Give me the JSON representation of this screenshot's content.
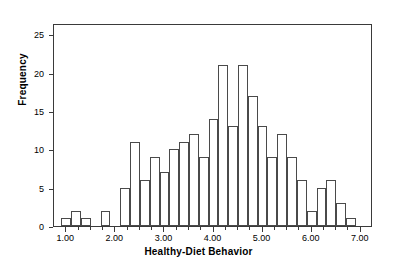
{
  "chart_data": {
    "type": "bar",
    "title": "",
    "xlabel": "Healthy-Diet Behavior",
    "ylabel": "Frequency",
    "xlim": [
      0.75,
      7.25
    ],
    "ylim": [
      0,
      26.5
    ],
    "grid": false,
    "legend": null,
    "bin_width": 0.2,
    "xticks": [
      "1.00",
      "2.00",
      "3.00",
      "4.00",
      "5.00",
      "6.00",
      "7.00"
    ],
    "xtick_values": [
      1,
      2,
      3,
      4,
      5,
      6,
      7
    ],
    "xtick_minor_values": [
      1.25,
      1.5,
      1.75,
      2.25,
      2.5,
      2.75,
      3.25,
      3.5,
      3.75,
      4.25,
      4.5,
      4.75,
      5.25,
      5.5,
      5.75,
      6.25,
      6.5,
      6.75
    ],
    "yticks": [
      "0",
      "5",
      "10",
      "15",
      "20",
      "25"
    ],
    "ytick_values": [
      0,
      5,
      10,
      15,
      20,
      25
    ],
    "bar_face_color": "#ffffff",
    "bar_edge_color": "#4a4a4a",
    "frame_color": "#3a3a3a",
    "bins": [
      {
        "x0": 0.9,
        "x1": 1.1,
        "center": 1.0,
        "value": 1
      },
      {
        "x0": 1.1,
        "x1": 1.3,
        "center": 1.2,
        "value": 2
      },
      {
        "x0": 1.3,
        "x1": 1.5,
        "center": 1.4,
        "value": 1
      },
      {
        "x0": 1.7,
        "x1": 1.9,
        "center": 1.8,
        "value": 2
      },
      {
        "x0": 2.1,
        "x1": 2.3,
        "center": 2.2,
        "value": 5
      },
      {
        "x0": 2.3,
        "x1": 2.5,
        "center": 2.4,
        "value": 11
      },
      {
        "x0": 2.5,
        "x1": 2.7,
        "center": 2.6,
        "value": 6
      },
      {
        "x0": 2.7,
        "x1": 2.9,
        "center": 2.8,
        "value": 9
      },
      {
        "x0": 2.9,
        "x1": 3.1,
        "center": 3.0,
        "value": 7
      },
      {
        "x0": 3.1,
        "x1": 3.3,
        "center": 3.2,
        "value": 10
      },
      {
        "x0": 3.3,
        "x1": 3.5,
        "center": 3.4,
        "value": 11
      },
      {
        "x0": 3.5,
        "x1": 3.7,
        "center": 3.6,
        "value": 12
      },
      {
        "x0": 3.7,
        "x1": 3.9,
        "center": 3.8,
        "value": 9
      },
      {
        "x0": 3.9,
        "x1": 4.1,
        "center": 4.0,
        "value": 14
      },
      {
        "x0": 4.1,
        "x1": 4.3,
        "center": 4.2,
        "value": 21
      },
      {
        "x0": 4.3,
        "x1": 4.5,
        "center": 4.4,
        "value": 13
      },
      {
        "x0": 4.5,
        "x1": 4.7,
        "center": 4.6,
        "value": 21
      },
      {
        "x0": 4.7,
        "x1": 4.9,
        "center": 4.8,
        "value": 17
      },
      {
        "x0": 4.9,
        "x1": 5.1,
        "center": 5.0,
        "value": 13
      },
      {
        "x0": 5.1,
        "x1": 5.3,
        "center": 5.2,
        "value": 9
      },
      {
        "x0": 5.3,
        "x1": 5.5,
        "center": 5.4,
        "value": 12
      },
      {
        "x0": 5.5,
        "x1": 5.7,
        "center": 5.6,
        "value": 9
      },
      {
        "x0": 5.7,
        "x1": 5.9,
        "center": 5.8,
        "value": 6
      },
      {
        "x0": 5.9,
        "x1": 6.1,
        "center": 6.0,
        "value": 2
      },
      {
        "x0": 6.1,
        "x1": 6.3,
        "center": 6.2,
        "value": 5
      },
      {
        "x0": 6.3,
        "x1": 6.5,
        "center": 6.4,
        "value": 6
      },
      {
        "x0": 6.5,
        "x1": 6.7,
        "center": 6.6,
        "value": 3
      },
      {
        "x0": 6.7,
        "x1": 6.9,
        "center": 6.8,
        "value": 1
      }
    ]
  }
}
